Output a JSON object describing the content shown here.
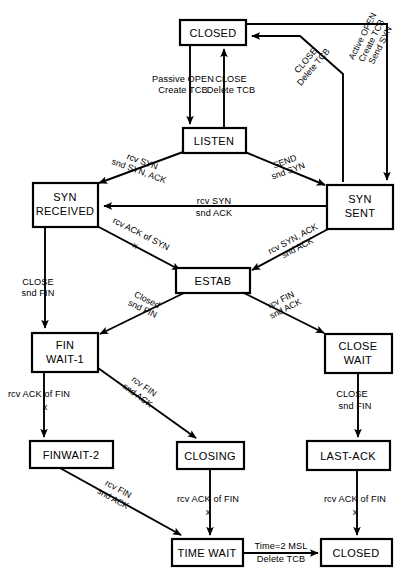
{
  "diagram": {
    "type": "state-machine",
    "colors": {
      "background": "#ffffff",
      "stroke": "#000000",
      "text": "#000000"
    },
    "states": [
      {
        "id": "closed-top",
        "label_line1": "CLOSED",
        "label_line2": ""
      },
      {
        "id": "listen",
        "label_line1": "LISTEN",
        "label_line2": ""
      },
      {
        "id": "syn-received",
        "label_line1": "SYN",
        "label_line2": "RECEIVED"
      },
      {
        "id": "syn-sent",
        "label_line1": "SYN",
        "label_line2": "SENT"
      },
      {
        "id": "estab",
        "label_line1": "ESTAB",
        "label_line2": ""
      },
      {
        "id": "fin-wait-1",
        "label_line1": "FIN",
        "label_line2": "WAIT-1"
      },
      {
        "id": "close-wait",
        "label_line1": "CLOSE",
        "label_line2": "WAIT"
      },
      {
        "id": "finwait-2",
        "label_line1": "FINWAIT-2",
        "label_line2": ""
      },
      {
        "id": "closing",
        "label_line1": "CLOSING",
        "label_line2": ""
      },
      {
        "id": "last-ack",
        "label_line1": "LAST-ACK",
        "label_line2": ""
      },
      {
        "id": "time-wait",
        "label_line1": "TIME WAIT",
        "label_line2": ""
      },
      {
        "id": "closed-bottom",
        "label_line1": "CLOSED",
        "label_line2": ""
      }
    ],
    "transitions": [
      {
        "id": "closed-to-listen",
        "from": "CLOSED",
        "to": "LISTEN",
        "line1": "Passive OPEN",
        "line2": "Create TCB",
        "line3": ""
      },
      {
        "id": "listen-to-closed",
        "from": "LISTEN",
        "to": "CLOSED",
        "line1": "CLOSE",
        "line2": "Delete TCB",
        "line3": ""
      },
      {
        "id": "closed-to-synsent",
        "from": "CLOSED",
        "to": "SYN SENT",
        "line1": "Active OPEN",
        "line2": "Create TCB",
        "line3": "Send SYN"
      },
      {
        "id": "synsent-to-closed",
        "from": "SYN SENT",
        "to": "CLOSED",
        "line1": "CLOSE",
        "line2": "Delete TCB",
        "line3": ""
      },
      {
        "id": "listen-to-synrcvd",
        "from": "LISTEN",
        "to": "SYN RECEIVED",
        "line1": "rcv SYN",
        "line2": "snd SYN, ACK",
        "line3": ""
      },
      {
        "id": "listen-to-synsent",
        "from": "LISTEN",
        "to": "SYN SENT",
        "line1": "SEND",
        "line2": "snd SYN",
        "line3": ""
      },
      {
        "id": "synsent-to-synrcvd",
        "from": "SYN SENT",
        "to": "SYN RECEIVED",
        "line1": "rcv SYN",
        "line2": "snd ACK",
        "line3": ""
      },
      {
        "id": "synrcvd-to-estab",
        "from": "SYN RECEIVED",
        "to": "ESTAB",
        "line1": "rcv ACK of SYN",
        "line2": "x",
        "line3": ""
      },
      {
        "id": "synsent-to-estab",
        "from": "SYN SENT",
        "to": "ESTAB",
        "line1": "rcv SYN, ACK",
        "line2": "snd ACK",
        "line3": ""
      },
      {
        "id": "synrcvd-to-finwait1",
        "from": "SYN RECEIVED",
        "to": "FIN WAIT-1",
        "line1": "CLOSE",
        "line2": "snd FIN",
        "line3": ""
      },
      {
        "id": "estab-to-finwait1",
        "from": "ESTAB",
        "to": "FIN WAIT-1",
        "line1": "Closed",
        "line2": "snd FIN",
        "line3": ""
      },
      {
        "id": "estab-to-closewait",
        "from": "ESTAB",
        "to": "CLOSE WAIT",
        "line1": "rcv FIN",
        "line2": "snd ACK",
        "line3": ""
      },
      {
        "id": "finwait1-to-finwait2",
        "from": "FIN WAIT-1",
        "to": "FINWAIT-2",
        "line1": "rcv ACK of FIN",
        "line2": "x",
        "line3": ""
      },
      {
        "id": "finwait1-to-closing",
        "from": "FIN WAIT-1",
        "to": "CLOSING",
        "line1": "rcv FIN",
        "line2": "snd ACK",
        "line3": ""
      },
      {
        "id": "closewait-to-lastack",
        "from": "CLOSE WAIT",
        "to": "LAST-ACK",
        "line1": "CLOSE",
        "line2": "snd FIN",
        "line3": ""
      },
      {
        "id": "finwait2-to-timewait",
        "from": "FINWAIT-2",
        "to": "TIME WAIT",
        "line1": "rcv FIN",
        "line2": "snd ACK",
        "line3": ""
      },
      {
        "id": "closing-to-timewait",
        "from": "CLOSING",
        "to": "TIME WAIT",
        "line1": "rcv ACK of FIN",
        "line2": "x",
        "line3": ""
      },
      {
        "id": "lastack-to-closed",
        "from": "LAST-ACK",
        "to": "CLOSED",
        "line1": "rcv ACK of FIN",
        "line2": "x",
        "line3": ""
      },
      {
        "id": "timewait-to-closed",
        "from": "TIME WAIT",
        "to": "CLOSED",
        "line1": "Time=2 MSL",
        "line2": "Delete TCB",
        "line3": ""
      }
    ]
  }
}
